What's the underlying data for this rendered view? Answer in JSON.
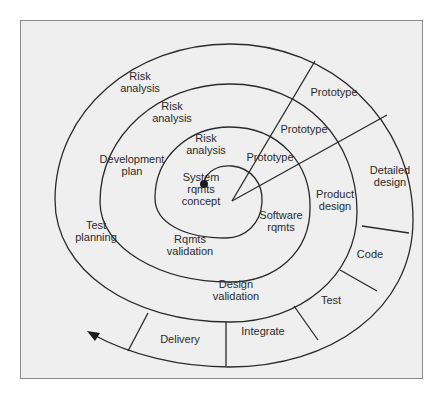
{
  "diagram": {
    "type": "spiral-model",
    "colors": {
      "background": "#efefef",
      "line": "#2a2a2a",
      "frame": "#8a8a8a"
    },
    "labels": [
      {
        "id": "risk-analysis-outer",
        "text_lines": [
          "Risk",
          "analysis"
        ],
        "x": 140,
        "y": 82
      },
      {
        "id": "risk-analysis-middle",
        "text_lines": [
          "Risk",
          "analysis"
        ],
        "x": 172,
        "y": 112
      },
      {
        "id": "risk-analysis-inner",
        "text_lines": [
          "Risk",
          "analysis"
        ],
        "x": 206,
        "y": 144
      },
      {
        "id": "prototype-outer",
        "text_lines": [
          "Prototype"
        ],
        "x": 334,
        "y": 92
      },
      {
        "id": "prototype-middle",
        "text_lines": [
          "Prototype"
        ],
        "x": 304,
        "y": 129
      },
      {
        "id": "prototype-inner",
        "text_lines": [
          "Prototype"
        ],
        "x": 270,
        "y": 157
      },
      {
        "id": "development-plan",
        "text_lines": [
          "Development",
          "plan"
        ],
        "x": 132,
        "y": 165
      },
      {
        "id": "system-rqmts-concept",
        "text_lines": [
          "System",
          "rqmts",
          "concept"
        ],
        "x": 201,
        "y": 189
      },
      {
        "id": "detailed-design",
        "text_lines": [
          "Detailed",
          "design"
        ],
        "x": 390,
        "y": 176
      },
      {
        "id": "product-design",
        "text_lines": [
          "Product",
          "design"
        ],
        "x": 335,
        "y": 200
      },
      {
        "id": "software-rqmts",
        "text_lines": [
          "Software",
          "rqmts"
        ],
        "x": 281,
        "y": 221
      },
      {
        "id": "test-planning",
        "text_lines": [
          "Test",
          "planning"
        ],
        "x": 96,
        "y": 231
      },
      {
        "id": "rqmts-validation",
        "text_lines": [
          "Rqmts",
          "validation"
        ],
        "x": 190,
        "y": 245
      },
      {
        "id": "code",
        "text_lines": [
          "Code"
        ],
        "x": 370,
        "y": 254
      },
      {
        "id": "design-validation",
        "text_lines": [
          "Design",
          "validation"
        ],
        "x": 236,
        "y": 290
      },
      {
        "id": "test",
        "text_lines": [
          "Test"
        ],
        "x": 331,
        "y": 300
      },
      {
        "id": "integrate",
        "text_lines": [
          "Integrate"
        ],
        "x": 263,
        "y": 331
      },
      {
        "id": "delivery",
        "text_lines": [
          "Delivery"
        ],
        "x": 180,
        "y": 339
      }
    ]
  }
}
